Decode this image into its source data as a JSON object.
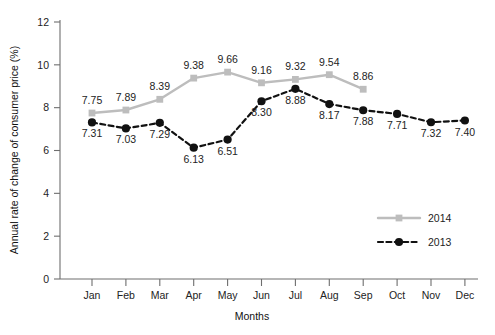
{
  "chart_data": {
    "type": "line",
    "title": "",
    "xlabel": "Months",
    "ylabel": "Annual rate of change of consumer price (%)",
    "categories": [
      "Jan",
      "Feb",
      "Mar",
      "Apr",
      "May",
      "Jun",
      "Jul",
      "Aug",
      "Sep",
      "Oct",
      "Nov",
      "Dec"
    ],
    "ylim": [
      0,
      12
    ],
    "yticks": [
      0,
      2,
      4,
      6,
      8,
      10,
      12
    ],
    "ytick_labels": [
      "0",
      "2",
      "4",
      "6",
      "8",
      "10",
      "12"
    ],
    "grid": false,
    "legend_position": "right-lower",
    "series": [
      {
        "name": "2014",
        "color": "#bdbdbd",
        "line_style": "solid",
        "marker": "square",
        "values": [
          7.75,
          7.89,
          8.39,
          9.38,
          9.66,
          9.16,
          9.32,
          9.54,
          8.86,
          null,
          null,
          null
        ],
        "labels": [
          "7.75",
          "7.89",
          "8.39",
          "9.38",
          "9.66",
          "9.16",
          "9.32",
          "9.54",
          "8.86",
          "",
          "",
          ""
        ],
        "label_positions": [
          "above",
          "above",
          "above",
          "above",
          "above",
          "above",
          "above",
          "above",
          "above",
          "",
          "",
          ""
        ]
      },
      {
        "name": "2013",
        "color": "#111111",
        "line_style": "dashed",
        "marker": "circle",
        "values": [
          7.31,
          7.03,
          7.29,
          6.13,
          6.51,
          8.3,
          8.88,
          8.17,
          7.88,
          7.71,
          7.32,
          7.4
        ],
        "labels": [
          "7.31",
          "7.03",
          "7.29",
          "6.13",
          "6.51",
          "8.30",
          "8.88",
          "8.17",
          "7.88",
          "7.71",
          "7.32",
          "7.40"
        ],
        "label_positions": [
          "below",
          "below",
          "below",
          "below",
          "below",
          "below",
          "below",
          "below",
          "below",
          "below",
          "below",
          "below"
        ]
      }
    ]
  },
  "legend": {
    "items": [
      {
        "label": "2014"
      },
      {
        "label": "2013"
      }
    ]
  },
  "colors": {
    "series_2014": "#bdbdbd",
    "series_2013": "#111111",
    "axis": "#6e6e6e",
    "text": "#232323",
    "background": "#ffffff"
  }
}
